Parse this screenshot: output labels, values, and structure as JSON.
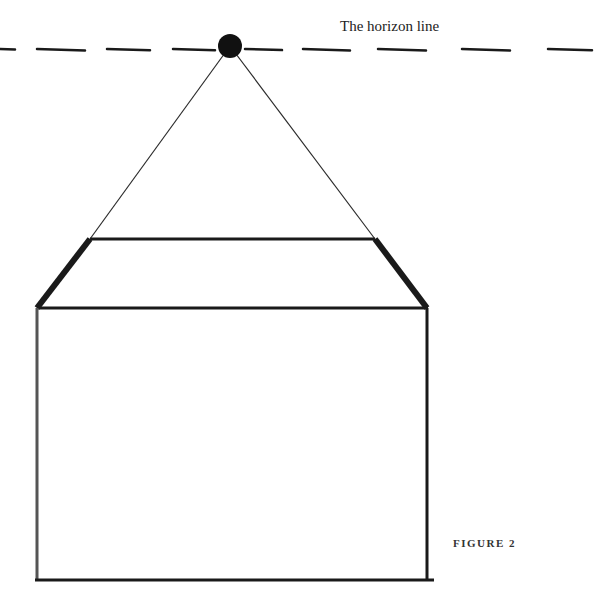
{
  "labels": {
    "horizon_line": "The horizon line",
    "figure": "FIGURE 2"
  },
  "colors": {
    "ink": "#1a1a1a",
    "background": "#ffffff"
  },
  "diagram": {
    "vanishing_point": {
      "x": 230,
      "y": 46,
      "r": 12
    },
    "horizon_y": 49,
    "horizon_dashes": [
      [
        0,
        15
      ],
      [
        37,
        85
      ],
      [
        107,
        150
      ],
      [
        173,
        215
      ],
      [
        245,
        282
      ],
      [
        303,
        350
      ],
      [
        378,
        426
      ],
      [
        462,
        510
      ],
      [
        548,
        592
      ]
    ],
    "top_face": {
      "back_left": [
        90,
        239
      ],
      "back_right": [
        375,
        239
      ],
      "front_left": [
        37,
        308
      ],
      "front_right": [
        427,
        308
      ]
    },
    "box": {
      "left": 37,
      "right": 427,
      "top": 308,
      "bottom": 580
    }
  }
}
